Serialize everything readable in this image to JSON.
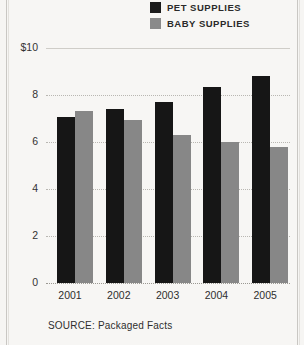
{
  "legend": {
    "items": [
      {
        "label": "PET SUPPLIES",
        "color": "#1b1b1b",
        "swatch": "pet-swatch"
      },
      {
        "label": "BABY SUPPLIES",
        "color": "#8a8a8a",
        "swatch": "baby-swatch"
      }
    ]
  },
  "source": {
    "text": "SOURCE: Packaged Facts"
  },
  "axis": {
    "y_ticks": [
      "$10",
      "8",
      "6",
      "4",
      "2",
      "0"
    ]
  },
  "chart_data": {
    "type": "bar",
    "title": "",
    "subtitle": "",
    "xlabel": "",
    "ylabel": "$10",
    "categories": [
      "2001",
      "2002",
      "2003",
      "2004",
      "2005"
    ],
    "series": [
      {
        "name": "PET SUPPLIES",
        "color": "#161616",
        "values": [
          7.05,
          7.4,
          7.7,
          8.35,
          8.8
        ]
      },
      {
        "name": "BABY SUPPLIES",
        "color": "#878787",
        "values": [
          7.3,
          6.95,
          6.3,
          6.0,
          5.8
        ]
      }
    ],
    "ylim": [
      0,
      10
    ],
    "yticks": [
      0,
      2,
      4,
      6,
      8,
      10
    ],
    "ytick_labels": [
      "0",
      "2",
      "4",
      "6",
      "8",
      "$10"
    ],
    "grid": true,
    "legend_position": "top-right",
    "annotations": [
      "SOURCE: Packaged Facts"
    ]
  }
}
